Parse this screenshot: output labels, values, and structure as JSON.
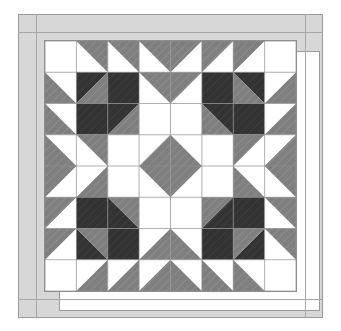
{
  "figure": {
    "kind": "quilt-block-diagram",
    "title": ""
  },
  "palette": {
    "background": "#ffffff",
    "light": "#ffffff",
    "medium": "#7f7f7f",
    "dark": "#333333",
    "border_fabric": "#d7d7d7",
    "seam_line": "#8d8d8d",
    "frame_outline": "#9a9a9a"
  },
  "border": {
    "label": "border",
    "outer": {
      "x": 18,
      "y": 14,
      "width": 305,
      "height": 304
    },
    "inner": {
      "x": 40,
      "y": 36,
      "width": 261,
      "height": 260
    },
    "strip_width": 22,
    "mitred": true
  },
  "grid": {
    "label": "pieced-grid",
    "rows": 8,
    "cols": 8,
    "cell_size": 31.5,
    "x": 44,
    "y": 40,
    "width": 253,
    "height": 252,
    "show_seam_lines": true
  },
  "legend": {
    "light_label": "light",
    "medium_label": "medium",
    "dark_label": "dark"
  },
  "chart_data": {
    "type": "heatmap",
    "xlabel": "",
    "ylabel": "",
    "categories": [
      "c1",
      "c2",
      "c3",
      "c4",
      "c5",
      "c6",
      "c7",
      "c8"
    ],
    "rowlabels": [
      "r1",
      "r2",
      "r3",
      "r4",
      "r5",
      "r6",
      "r7",
      "r8"
    ],
    "unit_codes": {
      "L": "solid light",
      "M": "solid medium",
      "D": "solid dark",
      "hst_tl_M": "half-square triangle, medium in top-left",
      "hst_tr_M": "half-square triangle, medium in top-right",
      "hst_bl_M": "half-square triangle, medium in bottom-left",
      "hst_br_M": "half-square triangle, medium in bottom-right",
      "hst_tl_D": "half-square triangle, dark in top-left",
      "hst_tr_D": "half-square triangle, dark in top-right",
      "hst_bl_D": "half-square triangle, dark in bottom-left",
      "hst_br_D": "half-square triangle, dark in bottom-right",
      "hst_tl_MD": "half-square triangle, medium top-left / dark bottom-right",
      "hst_tr_MD": "half-square triangle, medium top-right / dark bottom-left",
      "hst_bl_MD": "half-square triangle, medium bottom-left / dark top-right",
      "hst_br_MD": "half-square triangle, medium bottom-right / dark top-left"
    },
    "cells": [
      [
        "L",
        "hst_tr_M",
        "hst_tr_M",
        "hst_tr_M",
        "hst_tl_M",
        "hst_tl_M",
        "hst_tl_M",
        "L"
      ],
      [
        "hst_bl_M",
        "hst_br_MD",
        "D",
        "hst_tr_M",
        "hst_tl_M",
        "D",
        "hst_bl_MD",
        "hst_br_M"
      ],
      [
        "hst_bl_M",
        "D",
        "hst_br_MD",
        "L",
        "L",
        "hst_bl_MD",
        "D",
        "hst_br_M"
      ],
      [
        "hst_bl_M",
        "hst_tr_M",
        "L",
        "hst_br_M",
        "hst_bl_M",
        "L",
        "hst_tl_M",
        "hst_br_M"
      ],
      [
        "hst_tl_M",
        "hst_br_M",
        "L",
        "hst_tr_M",
        "hst_tl_M",
        "L",
        "hst_bl_M",
        "hst_tr_M"
      ],
      [
        "hst_tl_M",
        "D",
        "hst_tr_MD",
        "L",
        "L",
        "hst_tl_MD",
        "D",
        "hst_tr_M"
      ],
      [
        "hst_tl_M",
        "hst_tr_MD",
        "D",
        "hst_br_M",
        "hst_bl_M",
        "D",
        "hst_tl_MD",
        "hst_tr_M"
      ],
      [
        "L",
        "hst_br_M",
        "hst_br_M",
        "hst_br_M",
        "hst_bl_M",
        "hst_bl_M",
        "hst_bl_M",
        "L"
      ]
    ]
  }
}
